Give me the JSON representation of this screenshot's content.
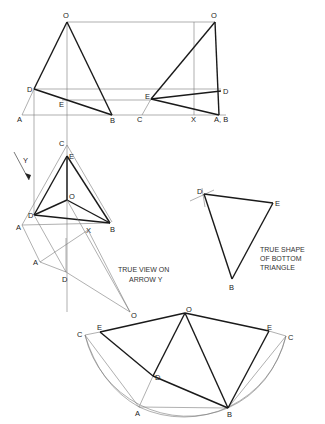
{
  "diagram": {
    "type": "technical-drawing",
    "views": {
      "front_elevation": {
        "labels": {
          "O": "O",
          "D": "D",
          "E": "E",
          "A": "A",
          "B": "B"
        }
      },
      "side_elevation": {
        "labels": {
          "O": "O",
          "E": "E",
          "D": "D",
          "C": "C",
          "X": "X",
          "AB": "A, B"
        }
      },
      "plan": {
        "labels": {
          "C": "C",
          "E": "E",
          "O": "O",
          "D": "D",
          "A": "A",
          "B": "B",
          "X": "X"
        }
      },
      "arrow": {
        "label": "Y"
      },
      "auxiliary_view": {
        "labels": {
          "A": "A",
          "D": "D",
          "O": "O"
        },
        "caption_line1": "TRUE VIEW ON",
        "caption_line2": "ARROW Y"
      },
      "true_shape": {
        "labels": {
          "D": "D",
          "E": "E",
          "B": "B"
        },
        "caption_line1": "TRUE SHAPE",
        "caption_line2": "OF BOTTOM",
        "caption_line3": "TRIANGLE"
      },
      "development": {
        "labels": {
          "O": "O",
          "E_left": "E",
          "C_left": "C",
          "D": "D",
          "A": "A",
          "B": "B",
          "E_right": "E",
          "C_right": "C"
        }
      }
    },
    "colors": {
      "construction_line": "#7a7a7a",
      "outline": "#1a1a1a",
      "background": "#ffffff"
    }
  }
}
